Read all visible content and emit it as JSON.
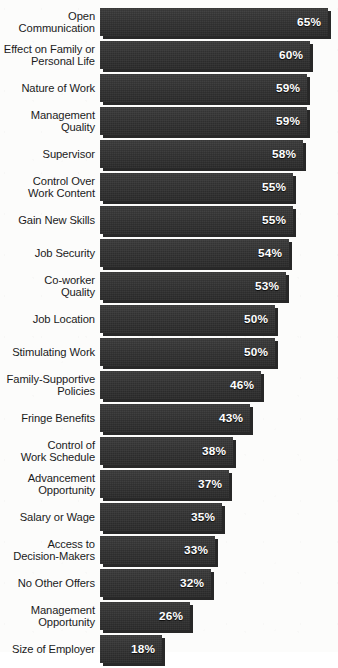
{
  "chart_data": {
    "type": "bar",
    "orientation": "horizontal",
    "title": "",
    "xlabel": "",
    "ylabel": "",
    "xlim": [
      0,
      65
    ],
    "grid": false,
    "legend": null,
    "value_suffix": "%",
    "categories": [
      "Open\nCommunication",
      "Effect on Family or\nPersonal Life",
      "Nature of Work",
      "Management\nQuality",
      "Supervisor",
      "Control Over\nWork Content",
      "Gain New Skills",
      "Job Security",
      "Co-worker\nQuality",
      "Job Location",
      "Stimulating Work",
      "Family-Supportive\nPolicies",
      "Fringe Benefits",
      "Control of\nWork Schedule",
      "Advancement\nOpportunity",
      "Salary or Wage",
      "Access to\nDecision-Makers",
      "No Other Offers",
      "Management\nOpportunity",
      "Size of Employer"
    ],
    "values": [
      65,
      60,
      59,
      59,
      58,
      55,
      55,
      54,
      53,
      50,
      50,
      46,
      43,
      38,
      37,
      35,
      33,
      32,
      26,
      18
    ],
    "value_labels": [
      "65%",
      "60%",
      "59%",
      "59%",
      "58%",
      "55%",
      "55%",
      "54%",
      "53%",
      "50%",
      "50%",
      "46%",
      "43%",
      "38%",
      "37%",
      "35%",
      "33%",
      "32%",
      "26%",
      "18%"
    ]
  },
  "style": {
    "bar_color": "#333333",
    "bar_shadow_color": "#0a0a0a",
    "value_text_color": "#ffffff",
    "label_text_color": "#1b1b1b",
    "background_color": "#fcfcfb"
  },
  "header": {
    "clipped_title": ""
  }
}
